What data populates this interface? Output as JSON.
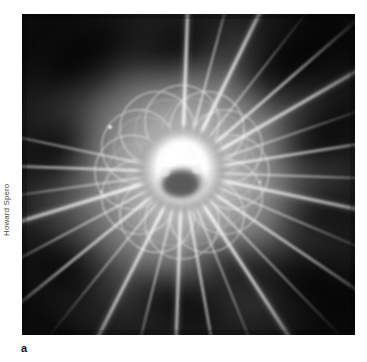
{
  "figure": {
    "panel_label": "a",
    "credit": "Howard Spero",
    "plate": {
      "left": 22,
      "top": 14,
      "width": 333,
      "height": 321,
      "background_color": "#050505"
    },
    "colors": {
      "page_background": "#ffffff",
      "photo_dark": "#0a0a0a",
      "photo_mid": "#6e6e6e",
      "photo_light": "#d8d8d8",
      "core_hot": "#ffffff",
      "credit_text": "#4c4c4c",
      "label_text": "#111111"
    },
    "structure": {
      "center_x": 182,
      "center_y": 172,
      "core_radius": 26,
      "dark_nucleus_radius": 15,
      "rosette_circle_count": 12,
      "rosette_orbit_radius": 48,
      "rosette_circle_radius": 36,
      "spine_count": 26
    },
    "spines": [
      {
        "angle": -88,
        "length": 250,
        "width": 3.2,
        "brightness": 0.95
      },
      {
        "angle": -75,
        "length": 215,
        "width": 2.2,
        "brightness": 0.78
      },
      {
        "angle": -64,
        "length": 240,
        "width": 3.4,
        "brightness": 0.98
      },
      {
        "angle": -52,
        "length": 205,
        "width": 2.0,
        "brightness": 0.72
      },
      {
        "angle": -41,
        "length": 235,
        "width": 2.8,
        "brightness": 0.88
      },
      {
        "angle": -30,
        "length": 250,
        "width": 3.0,
        "brightness": 0.92
      },
      {
        "angle": -19,
        "length": 210,
        "width": 2.0,
        "brightness": 0.7
      },
      {
        "angle": -9,
        "length": 245,
        "width": 2.6,
        "brightness": 0.85
      },
      {
        "angle": 2,
        "length": 230,
        "width": 2.2,
        "brightness": 0.76
      },
      {
        "angle": 12,
        "length": 250,
        "width": 3.0,
        "brightness": 0.9
      },
      {
        "angle": 23,
        "length": 215,
        "width": 2.0,
        "brightness": 0.7
      },
      {
        "angle": 34,
        "length": 245,
        "width": 2.8,
        "brightness": 0.86
      },
      {
        "angle": 46,
        "length": 225,
        "width": 2.2,
        "brightness": 0.74
      },
      {
        "angle": 57,
        "length": 250,
        "width": 3.2,
        "brightness": 0.94
      },
      {
        "angle": 68,
        "length": 215,
        "width": 2.0,
        "brightness": 0.7
      },
      {
        "angle": 80,
        "length": 240,
        "width": 2.6,
        "brightness": 0.84
      },
      {
        "angle": 92,
        "length": 250,
        "width": 3.0,
        "brightness": 0.9
      },
      {
        "angle": 104,
        "length": 220,
        "width": 2.2,
        "brightness": 0.74
      },
      {
        "angle": 117,
        "length": 248,
        "width": 3.1,
        "brightness": 0.93
      },
      {
        "angle": 129,
        "length": 210,
        "width": 2.0,
        "brightness": 0.7
      },
      {
        "angle": 141,
        "length": 245,
        "width": 2.8,
        "brightness": 0.87
      },
      {
        "angle": 152,
        "length": 230,
        "width": 2.2,
        "brightness": 0.75
      },
      {
        "angle": 163,
        "length": 250,
        "width": 3.3,
        "brightness": 0.96
      },
      {
        "angle": 172,
        "length": 215,
        "width": 2.0,
        "brightness": 0.7
      },
      {
        "angle": -178,
        "length": 240,
        "width": 2.6,
        "brightness": 0.83
      },
      {
        "angle": -168,
        "length": 225,
        "width": 2.1,
        "brightness": 0.73
      }
    ],
    "dark_patches": [
      {
        "cx": 60,
        "cy": 40,
        "rx": 52,
        "ry": 30,
        "rot": -28
      },
      {
        "cx": 155,
        "cy": 30,
        "rx": 46,
        "ry": 24,
        "rot": -15
      },
      {
        "cx": 275,
        "cy": 42,
        "rx": 56,
        "ry": 32,
        "rot": -30
      },
      {
        "cx": 305,
        "cy": 120,
        "rx": 44,
        "ry": 26,
        "rot": -35
      },
      {
        "cx": 30,
        "cy": 135,
        "rx": 38,
        "ry": 24,
        "rot": -40
      },
      {
        "cx": 40,
        "cy": 255,
        "rx": 42,
        "ry": 22,
        "rot": 25
      },
      {
        "cx": 160,
        "cy": 290,
        "rx": 50,
        "ry": 24,
        "rot": 12
      },
      {
        "cx": 290,
        "cy": 270,
        "rx": 48,
        "ry": 28,
        "rot": 32
      },
      {
        "cx": 300,
        "cy": 200,
        "rx": 36,
        "ry": 20,
        "rot": -10
      }
    ],
    "bright_specks": [
      {
        "cx": 88,
        "cy": 113,
        "r": 2.0
      },
      {
        "cx": 238,
        "cy": 168,
        "r": 1.4
      },
      {
        "cx": 79,
        "cy": 178,
        "r": 1.2
      }
    ]
  }
}
